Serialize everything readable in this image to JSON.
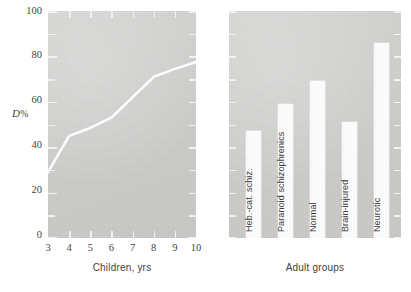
{
  "figure": {
    "background_color": "#ffffff",
    "panel_fill": "#cfcfcd",
    "series_color": "#ffffff",
    "tick_color": "#f4f4f2",
    "text_color": "#3f3f3f"
  },
  "chart_data": [
    {
      "type": "line",
      "panel": "left",
      "title": "",
      "xlabel": "Children, yrs",
      "ylabel": "D%",
      "xlim": [
        3,
        10
      ],
      "ylim": [
        0,
        100
      ],
      "grid": false,
      "legend": "none",
      "x_ticklabels": [
        "3",
        "4",
        "5",
        "6",
        "7",
        "8",
        "9",
        "10"
      ],
      "y_ticklabels": [
        "0",
        "20",
        "40",
        "60",
        "80",
        "100"
      ],
      "y_minor_interval": 10,
      "x": [
        3,
        4,
        5,
        6,
        7,
        8,
        9,
        10
      ],
      "values": [
        29,
        45,
        48.5,
        53,
        62,
        71,
        74.5,
        77.5
      ],
      "series": [
        {
          "name": "D%",
          "values": [
            29,
            45,
            48.5,
            53,
            62,
            71,
            74.5,
            77.5
          ]
        }
      ]
    },
    {
      "type": "bar",
      "panel": "right",
      "title": "",
      "xlabel": "Adult groups",
      "ylabel": "",
      "ylim": [
        0,
        100
      ],
      "grid": false,
      "legend": "none",
      "y_minor_interval": 10,
      "categories": [
        "Heb.-cat. schiz.",
        "Paranoid schizophrenics",
        "Normal",
        "Brain-injured",
        "Neurotic"
      ],
      "values": [
        47,
        59,
        69,
        51,
        86
      ]
    }
  ],
  "left_panel": {
    "y_axis_title": "D",
    "y_axis_title_suffix": "%",
    "x_axis_title": "Children, yrs",
    "y_ticklabels": [
      "100",
      "80",
      "60",
      "40",
      "20",
      "0"
    ],
    "x_ticklabels": [
      "3",
      "4",
      "5",
      "6",
      "7",
      "8",
      "9",
      "10"
    ]
  },
  "right_panel": {
    "x_axis_title": "Adult groups",
    "bars": [
      {
        "label": "Heb.-cat. schiz.",
        "value": 47
      },
      {
        "label": "Paranoid schizophrenics",
        "value": 59
      },
      {
        "label": "Normal",
        "value": 69
      },
      {
        "label": "Brain-injured",
        "value": 51
      },
      {
        "label": "Neurotic",
        "value": 86
      }
    ]
  }
}
